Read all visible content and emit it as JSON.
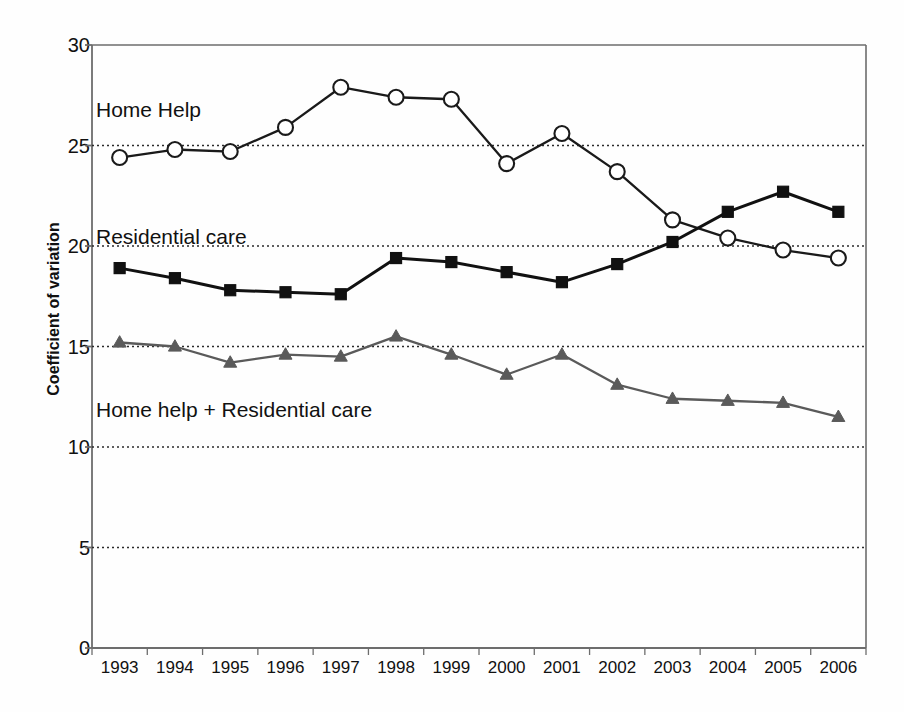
{
  "chart_data": {
    "type": "line",
    "title": "",
    "xlabel": "",
    "ylabel": "Coefficient of variation",
    "categories": [
      "1993",
      "1994",
      "1995",
      "1996",
      "1997",
      "1998",
      "1999",
      "2000",
      "2001",
      "2002",
      "2003",
      "2004",
      "2005",
      "2006"
    ],
    "ylim": [
      0,
      30
    ],
    "yticks": [
      0,
      5,
      10,
      15,
      20,
      25,
      30
    ],
    "grid": "horizontal-dotted",
    "legend": "inline-annotations",
    "series": [
      {
        "name": "Home Help",
        "marker": "open-circle",
        "color": "#1a1a1a",
        "values": [
          24.4,
          24.8,
          24.7,
          25.9,
          27.9,
          27.4,
          27.3,
          24.1,
          25.6,
          23.7,
          21.3,
          20.4,
          19.8,
          19.4
        ]
      },
      {
        "name": "Residential care",
        "marker": "filled-square",
        "color": "#111111",
        "values": [
          18.9,
          18.4,
          17.8,
          17.7,
          17.6,
          19.4,
          19.2,
          18.7,
          18.2,
          19.1,
          20.2,
          21.7,
          22.7,
          21.7
        ]
      },
      {
        "name": "Home help + Residential care",
        "marker": "filled-triangle",
        "color": "#5a5a5a",
        "values": [
          15.2,
          15.0,
          14.2,
          14.6,
          14.5,
          15.5,
          14.6,
          13.6,
          14.6,
          13.1,
          12.4,
          12.3,
          12.2,
          11.5
        ]
      }
    ]
  },
  "axes": {
    "y_title": "Coefficient of variation",
    "y_tick_labels": [
      "30",
      "25",
      "20",
      "15",
      "10",
      "5",
      "0"
    ],
    "x_tick_labels": [
      "1993",
      "1994",
      "1995",
      "1996",
      "1997",
      "1998",
      "1999",
      "2000",
      "2001",
      "2002",
      "2003",
      "2004",
      "2005",
      "2006"
    ]
  },
  "annotations": [
    {
      "name": "home-help",
      "text": "Home Help",
      "x": 96,
      "y": 98
    },
    {
      "name": "residential-care",
      "text": "Residential care",
      "x": 96,
      "y": 225
    },
    {
      "name": "home-help-plus-residential-care",
      "text": "Home help + Residential care",
      "x": 96,
      "y": 398
    }
  ],
  "colors": {
    "series_home_help": "#1a1a1a",
    "series_residential": "#111111",
    "series_combined": "#5a5a5a",
    "grid": "#2b2b2b",
    "axis": "#6d6d6d",
    "background": "#fefefe"
  }
}
